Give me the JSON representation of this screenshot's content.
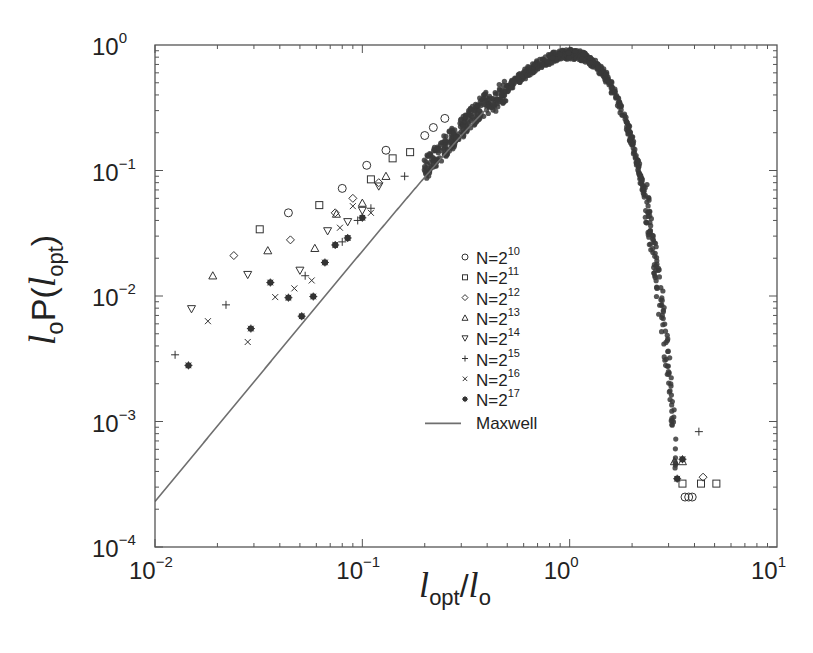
{
  "chart_data": {
    "type": "scatter",
    "title": "",
    "xlabel": "l_opt / l_o",
    "ylabel": "l_o P(l_opt)",
    "xscale": "log",
    "yscale": "log",
    "xlim": [
      0.01,
      10
    ],
    "ylim": [
      0.0001,
      1
    ],
    "x_ticks": [
      {
        "base": "10",
        "exp": "-2",
        "value": 0.01
      },
      {
        "base": "10",
        "exp": "-1",
        "value": 0.1
      },
      {
        "base": "10",
        "exp": "0",
        "value": 1
      },
      {
        "base": "10",
        "exp": "1",
        "value": 10
      }
    ],
    "y_ticks": [
      {
        "base": "10",
        "exp": "0",
        "value": 1
      },
      {
        "base": "10",
        "exp": "-1",
        "value": 0.1
      },
      {
        "base": "10",
        "exp": "-2",
        "value": 0.01
      },
      {
        "base": "10",
        "exp": "-3",
        "value": 0.001
      },
      {
        "base": "10",
        "exp": "-4",
        "value": 0.0001
      }
    ],
    "grid": false,
    "legend_position": "inside-center",
    "legend": [
      {
        "marker": "circle",
        "label_base": "N=2",
        "label_exp": "10"
      },
      {
        "marker": "square",
        "label_base": "N=2",
        "label_exp": "11"
      },
      {
        "marker": "diamond",
        "label_base": "N=2",
        "label_exp": "12"
      },
      {
        "marker": "triangle-up",
        "label_base": "N=2",
        "label_exp": "13"
      },
      {
        "marker": "triangle-down",
        "label_base": "N=2",
        "label_exp": "14"
      },
      {
        "marker": "plus",
        "label_base": "N=2",
        "label_exp": "15"
      },
      {
        "marker": "cross",
        "label_base": "N=2",
        "label_exp": "16"
      },
      {
        "marker": "asterisk",
        "label_base": "N=2",
        "label_exp": "17"
      },
      {
        "marker": "line",
        "label_base": "Maxwell",
        "label_exp": ""
      }
    ],
    "maxwell_curve": {
      "formula": "2.3 * x^2 * exp(-x^2)",
      "x": [
        0.01,
        0.02,
        0.05,
        0.1,
        0.2,
        0.3,
        0.5,
        0.7,
        1.0,
        1.3,
        1.6,
        2.0,
        2.4,
        2.8,
        3.2,
        3.55
      ],
      "y": [
        0.00023,
        0.00092,
        0.0057,
        0.0228,
        0.088,
        0.189,
        0.448,
        0.689,
        0.846,
        0.714,
        0.455,
        0.168,
        0.0417,
        0.0071,
        0.00085,
        0.0001
      ]
    },
    "series": [
      {
        "name": "N=2^10",
        "marker": "circle",
        "points": [
          [
            0.044,
            0.046
          ],
          [
            0.08,
            0.072
          ],
          [
            0.105,
            0.11
          ],
          [
            0.13,
            0.145
          ],
          [
            0.2,
            0.19
          ],
          [
            0.22,
            0.22
          ],
          [
            0.25,
            0.26
          ],
          [
            3.6,
            0.00025
          ],
          [
            3.75,
            0.00025
          ],
          [
            3.9,
            0.00025
          ]
        ]
      },
      {
        "name": "N=2^11",
        "marker": "square",
        "points": [
          [
            0.032,
            0.034
          ],
          [
            0.062,
            0.053
          ],
          [
            0.11,
            0.085
          ],
          [
            0.14,
            0.125
          ],
          [
            0.17,
            0.14
          ],
          [
            3.5,
            0.00032
          ],
          [
            4.3,
            0.00032
          ],
          [
            5.1,
            0.00032
          ]
        ]
      },
      {
        "name": "N=2^12",
        "marker": "diamond",
        "points": [
          [
            0.024,
            0.021
          ],
          [
            0.045,
            0.028
          ],
          [
            0.074,
            0.046
          ],
          [
            0.09,
            0.06
          ],
          [
            0.12,
            0.08
          ],
          [
            4.4,
            0.00036
          ]
        ]
      },
      {
        "name": "N=2^13",
        "marker": "triangle-up",
        "points": [
          [
            0.019,
            0.0145
          ],
          [
            0.035,
            0.023
          ],
          [
            0.059,
            0.024
          ],
          [
            0.075,
            0.045
          ],
          [
            0.1,
            0.055
          ],
          [
            0.13,
            0.09
          ],
          [
            3.2,
            0.00048
          ],
          [
            3.5,
            0.00048
          ]
        ]
      },
      {
        "name": "N=2^14",
        "marker": "triangle-down",
        "points": [
          [
            0.015,
            0.0079
          ],
          [
            0.028,
            0.0148
          ],
          [
            0.05,
            0.016
          ],
          [
            0.068,
            0.033
          ],
          [
            0.085,
            0.039
          ],
          [
            0.1,
            0.048
          ],
          [
            0.12,
            0.075
          ]
        ]
      },
      {
        "name": "N=2^15",
        "marker": "plus",
        "points": [
          [
            0.0125,
            0.0034
          ],
          [
            0.022,
            0.0085
          ],
          [
            0.053,
            0.0145
          ],
          [
            0.08,
            0.027
          ],
          [
            0.095,
            0.04
          ],
          [
            0.11,
            0.05
          ],
          [
            0.16,
            0.09
          ],
          [
            4.2,
            0.00083
          ]
        ]
      },
      {
        "name": "N=2^16",
        "marker": "cross",
        "points": [
          [
            0.018,
            0.0063
          ],
          [
            0.028,
            0.0043
          ],
          [
            0.038,
            0.0098
          ],
          [
            0.047,
            0.0115
          ],
          [
            0.057,
            0.0133
          ],
          [
            0.078,
            0.035
          ],
          [
            0.09,
            0.052
          ],
          [
            0.11,
            0.046
          ]
        ]
      },
      {
        "name": "N=2^17",
        "marker": "asterisk",
        "points": [
          [
            0.0145,
            0.0028
          ],
          [
            0.029,
            0.0055
          ],
          [
            0.036,
            0.0128
          ],
          [
            0.044,
            0.0097
          ],
          [
            0.051,
            0.0069
          ],
          [
            0.058,
            0.0099
          ],
          [
            0.066,
            0.0185
          ],
          [
            0.074,
            0.0255
          ],
          [
            0.085,
            0.029
          ],
          [
            0.1,
            0.042
          ],
          [
            3.3,
            0.00035
          ],
          [
            3.5,
            0.0005
          ]
        ]
      }
    ]
  }
}
